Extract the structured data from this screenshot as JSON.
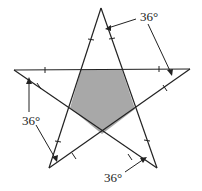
{
  "figure": {
    "type": "five-pointed star with shaded central pentagon",
    "fill_color": "#a8a8a8",
    "line_color": "#222222",
    "vertices": {
      "top": [
        101,
        8
      ],
      "left": [
        14,
        70
      ],
      "right": [
        190,
        69
      ],
      "bottom_left": [
        49,
        168
      ],
      "bottom_right": [
        157,
        168
      ]
    },
    "pentagon": [
      [
        81,
        70
      ],
      [
        122,
        70
      ],
      [
        135,
        109
      ],
      [
        102,
        134
      ],
      [
        70,
        108
      ]
    ]
  },
  "labels": [
    {
      "id": "angle-top-right",
      "text": "36°",
      "x": 140,
      "y": 10
    },
    {
      "id": "angle-left",
      "text": "36°",
      "x": 22,
      "y": 114
    },
    {
      "id": "angle-bottom-right",
      "text": "36°",
      "x": 104,
      "y": 171
    }
  ]
}
